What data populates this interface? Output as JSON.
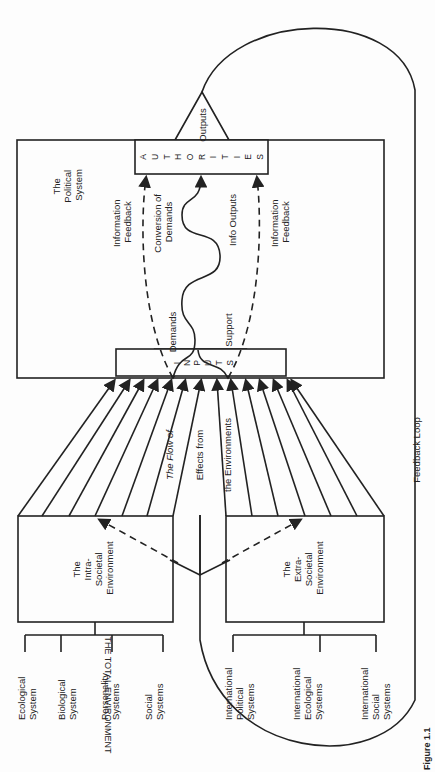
{
  "diagram": {
    "political_system": {
      "title": [
        "The",
        "Political",
        "System"
      ]
    },
    "authorities": {
      "letters": [
        "A",
        "U",
        "T",
        "H",
        "O",
        "R",
        "I",
        "T",
        "I",
        "E",
        "S"
      ]
    },
    "outputs_label": "Outputs",
    "inputs": {
      "letters": [
        "I",
        "N",
        "P",
        "U",
        "T",
        "S"
      ]
    },
    "demands_label": "Demands",
    "support_label": "Support",
    "info_feedback_left": [
      "Information",
      "Feedback"
    ],
    "info_feedback_right": [
      "Information",
      "Feedback"
    ],
    "conversion_label": [
      "Conversion of",
      "Demands"
    ],
    "info_outputs_label": "Info Outputs",
    "flow_label": [
      "The Flow of",
      "Effects from",
      "the Environments"
    ],
    "intra_env": {
      "title": [
        "The",
        "Intra-",
        "Societal",
        "Environment"
      ]
    },
    "extra_env": {
      "title": [
        "The",
        "Extra-",
        "Societal",
        "Environment"
      ]
    },
    "intra_subsystems": [
      [
        "Ecological",
        "System"
      ],
      [
        "Biological",
        "System"
      ],
      [
        "Personality",
        "Systems"
      ],
      [
        "Social",
        "Systems"
      ]
    ],
    "extra_subsystems": [
      [
        "International",
        "Political",
        "Systems"
      ],
      [
        "International",
        "Ecological",
        "Systems"
      ],
      [
        "International",
        "Social",
        "Systems"
      ]
    ],
    "total_env_label": "THE TOTAL ENVIRONMENT",
    "feedback_loop_label": "Feedback Loop",
    "figure_caption": "Figure 1.1"
  }
}
